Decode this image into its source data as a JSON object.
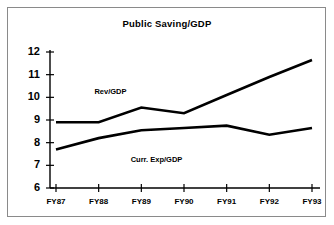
{
  "chart_data": {
    "type": "line",
    "title": "Public Saving/GDP",
    "xlabel": "",
    "ylabel": "",
    "categories": [
      "FY87",
      "FY88",
      "FY89",
      "FY90",
      "FY91",
      "FY92",
      "FY93"
    ],
    "series": [
      {
        "name": "Rev/GDP",
        "values": [
          8.9,
          8.9,
          9.55,
          9.3,
          10.1,
          10.9,
          11.65
        ]
      },
      {
        "name": "Curr. Exp/GDP",
        "values": [
          7.7,
          8.2,
          8.55,
          8.65,
          8.75,
          8.35,
          8.65
        ]
      }
    ],
    "ylim": [
      6,
      12
    ],
    "yticks": [
      6,
      7,
      8,
      9,
      10,
      11,
      12
    ],
    "ytick_labels": [
      "6",
      "7",
      "8",
      "9",
      "10",
      "11",
      "12"
    ],
    "grid": false,
    "legend": "inline-annotations",
    "annotations": [
      {
        "text": "Rev/GDP",
        "x": 0.9,
        "y": 10.25
      },
      {
        "text": "Curr. Exp/GDP",
        "x": 1.75,
        "y": 7.25
      }
    ],
    "line_color": "#000000",
    "axis_color": "#000000",
    "background_color": "#ffffff"
  },
  "figure": {
    "border_color": "#8a8a8a"
  }
}
